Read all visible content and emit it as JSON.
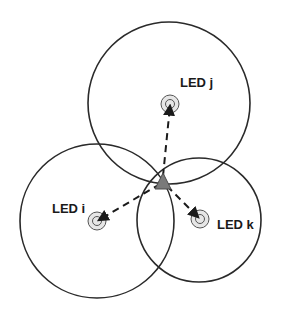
{
  "diagram": {
    "type": "trilateration",
    "colors": {
      "stroke": "#2a2a2a",
      "marker_fill": "#e6e6e6",
      "receiver_fill": "#7a7a7a",
      "background": "#ffffff"
    },
    "leds": [
      {
        "id": "j",
        "label": "LED j",
        "cx": 170,
        "cy": 104,
        "range_r": 81,
        "circle_cx": 169,
        "circle_cy": 103,
        "label_x": 180,
        "label_y": 83
      },
      {
        "id": "i",
        "label": "LED i",
        "cx": 97,
        "cy": 221,
        "range_r": 77,
        "circle_cx": 97,
        "circle_cy": 221,
        "label_x": 52,
        "label_y": 209
      },
      {
        "id": "k",
        "label": "LED k",
        "cx": 200,
        "cy": 219,
        "range_r": 62,
        "circle_cx": 199,
        "circle_cy": 220,
        "label_x": 217,
        "label_y": 225
      }
    ],
    "receiver": {
      "shape": "triangle",
      "apex": [
        163,
        173
      ],
      "base_left": [
        155,
        189
      ],
      "base_right": [
        171,
        189
      ],
      "center": [
        163,
        182
      ]
    }
  }
}
